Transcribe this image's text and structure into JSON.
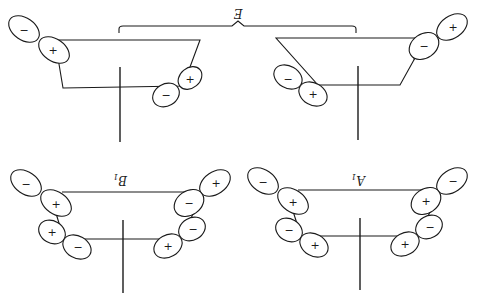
{
  "figure": {
    "orientation": "rotated-180",
    "colors": {
      "ink": "#1a1a1a",
      "background": "#ffffff"
    }
  },
  "labels": {
    "e": {
      "text": "E"
    },
    "b1": {
      "main": "B",
      "sub": "1"
    },
    "a1": {
      "main": "A",
      "sub": "1"
    }
  },
  "panels": [
    {
      "name": "E-left",
      "lobes": [
        {
          "sign": "−"
        },
        {
          "sign": "+"
        },
        {
          "sign": "+"
        },
        {
          "sign": "−"
        }
      ]
    },
    {
      "name": "E-right",
      "lobes": [
        {
          "sign": "+"
        },
        {
          "sign": "−"
        },
        {
          "sign": "−"
        },
        {
          "sign": "+"
        }
      ]
    },
    {
      "name": "B1",
      "lobes": [
        {
          "sign": "−"
        },
        {
          "sign": "+"
        },
        {
          "sign": "+"
        },
        {
          "sign": "−"
        },
        {
          "sign": "+"
        },
        {
          "sign": "−"
        },
        {
          "sign": "−"
        },
        {
          "sign": "+"
        }
      ]
    },
    {
      "name": "A1",
      "lobes": [
        {
          "sign": "−"
        },
        {
          "sign": "+"
        },
        {
          "sign": "−"
        },
        {
          "sign": "+"
        },
        {
          "sign": "−"
        },
        {
          "sign": "+"
        },
        {
          "sign": "−"
        },
        {
          "sign": "+"
        }
      ]
    }
  ]
}
